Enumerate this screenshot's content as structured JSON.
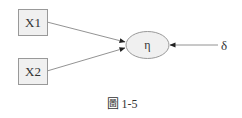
{
  "diagram": {
    "nodes": [
      {
        "id": "x1",
        "label": "X1",
        "shape": "rect"
      },
      {
        "id": "x2",
        "label": "X2",
        "shape": "rect"
      },
      {
        "id": "eta",
        "label": "η",
        "shape": "ellipse"
      },
      {
        "id": "delta",
        "label": "δ",
        "shape": "text"
      }
    ],
    "edges": [
      {
        "from": "x1",
        "to": "eta"
      },
      {
        "from": "x2",
        "to": "eta"
      },
      {
        "from": "delta",
        "to": "eta"
      }
    ],
    "caption": "圖 1-5",
    "colors": {
      "fill": "#f0f0f0",
      "stroke": "#888888",
      "text": "#333333"
    }
  }
}
